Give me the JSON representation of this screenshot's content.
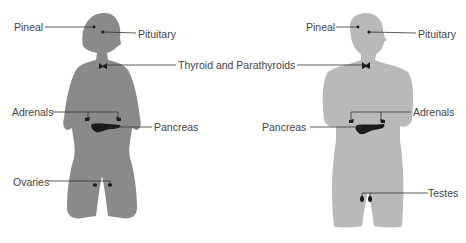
{
  "colors": {
    "female_body": "#8a8a8a",
    "male_body": "#b9b9b9",
    "gland": "#1a1a1a",
    "leader_line": "#333333",
    "label_text": "#444444"
  },
  "female": {
    "labels": {
      "pineal": "Pineal",
      "pituitary": "Pituitary",
      "adrenals": "Adrenals",
      "pancreas": "Pancreas",
      "ovaries": "Ovaries"
    }
  },
  "shared": {
    "thyroid": "Thyroid and Parathyroids"
  },
  "male": {
    "labels": {
      "pineal": "Pineal",
      "pituitary": "Pituitary",
      "adrenals": "Adrenals",
      "pancreas": "Pancreas",
      "testes": "Testes"
    }
  }
}
